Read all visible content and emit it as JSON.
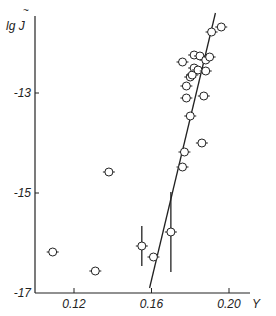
{
  "chart_data": {
    "type": "scatter",
    "title": "",
    "xlabel": "Y",
    "ylabel": "lg J~",
    "xlim": [
      0.1,
      0.215
    ],
    "ylim": [
      -17,
      -11.2
    ],
    "x_ticks": [
      0.12,
      0.16,
      0.2
    ],
    "x_tick_labels": [
      "0.12",
      "0.16",
      "0.20"
    ],
    "y_ticks": [
      -13,
      -15,
      -17
    ],
    "y_tick_labels": [
      "-13",
      "-15",
      "-17"
    ],
    "grid": false,
    "legend": null,
    "series": [
      {
        "name": "data points",
        "marker": "open-circle",
        "points": [
          {
            "x": 0.109,
            "y": -16.18
          },
          {
            "x": 0.131,
            "y": -16.56
          },
          {
            "x": 0.138,
            "y": -14.58
          },
          {
            "x": 0.155,
            "y": -16.06,
            "yerr": 0.4
          },
          {
            "x": 0.161,
            "y": -16.28
          },
          {
            "x": 0.17,
            "y": -15.78,
            "yerr": 0.8
          },
          {
            "x": 0.176,
            "y": -12.38
          },
          {
            "x": 0.176,
            "y": -14.48
          },
          {
            "x": 0.177,
            "y": -14.18
          },
          {
            "x": 0.178,
            "y": -13.1
          },
          {
            "x": 0.178,
            "y": -12.86
          },
          {
            "x": 0.18,
            "y": -12.68
          },
          {
            "x": 0.18,
            "y": -13.46
          },
          {
            "x": 0.181,
            "y": -12.64
          },
          {
            "x": 0.182,
            "y": -12.24
          },
          {
            "x": 0.182,
            "y": -12.5
          },
          {
            "x": 0.184,
            "y": -12.54
          },
          {
            "x": 0.186,
            "y": -14.0
          },
          {
            "x": 0.187,
            "y": -13.06
          },
          {
            "x": 0.188,
            "y": -12.56
          },
          {
            "x": 0.185,
            "y": -12.26
          },
          {
            "x": 0.188,
            "y": -12.34
          },
          {
            "x": 0.19,
            "y": -12.28
          },
          {
            "x": 0.191,
            "y": -11.78
          },
          {
            "x": 0.196,
            "y": -11.68
          }
        ]
      },
      {
        "name": "fit line",
        "type": "line",
        "points": [
          {
            "x": 0.159,
            "y": -16.9
          },
          {
            "x": 0.193,
            "y": -11.4
          }
        ]
      }
    ]
  }
}
